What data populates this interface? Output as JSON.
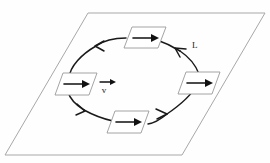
{
  "figure": {
    "plane": {
      "name": "plane-parallelogram",
      "corners": [
        [
          88,
          13
        ],
        [
          265,
          13
        ],
        [
          182,
          155
        ],
        [
          5,
          155
        ]
      ],
      "stroke_color": "#a8a8a8"
    },
    "loop": {
      "name": "current-loop",
      "label": "L",
      "label_position": [
        192,
        48
      ],
      "center": [
        136,
        83
      ],
      "radius_x": 68,
      "radius_y": 45,
      "direction": "counterclockwise-in-plane",
      "stroke_color": "#1a1a1a"
    },
    "vector_label": {
      "symbol": "v",
      "description": "velocity vector v with overbar arrow",
      "position": [
        104,
        90
      ]
    },
    "plates": [
      {
        "name": "plate-top",
        "position": [
          145,
          37
        ],
        "arrow_direction": "right"
      },
      {
        "name": "plate-left",
        "position": [
          76,
          84
        ],
        "arrow_direction": "right"
      },
      {
        "name": "plate-right",
        "position": [
          199,
          83
        ],
        "arrow_direction": "right"
      },
      {
        "name": "plate-bottom",
        "position": [
          128,
          122
        ],
        "arrow_direction": "right"
      }
    ],
    "loop_arrowheads": [
      {
        "name": "arrowhead-top-left",
        "position": [
          103,
          46
        ],
        "points": "left-down"
      },
      {
        "name": "arrowhead-top-right",
        "position": [
          176,
          48
        ],
        "points": "up-left"
      },
      {
        "name": "arrowhead-bottom-left",
        "position": [
          84,
          108
        ],
        "points": "down-right"
      },
      {
        "name": "arrowhead-bottom-right",
        "position": [
          163,
          113
        ],
        "points": "right"
      }
    ],
    "colors": {
      "ink": "#1a1a1a",
      "plane_line": "#a8a8a8",
      "plate_line": "#9a9a9a",
      "background": "#fefefe"
    }
  }
}
